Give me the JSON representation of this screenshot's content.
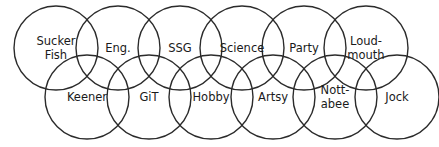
{
  "diagram": {
    "type": "circle-chain-venn",
    "canvas": {
      "width": 439,
      "height": 147,
      "background": "#ffffff"
    },
    "stroke_color": "#2b2b2b",
    "text_color": "#1a1a1a",
    "rows": [
      {
        "name": "top-row",
        "center_y": 48,
        "radius": 42,
        "nodes": [
          {
            "id": "sucker-fish",
            "label": "Sucker Fish",
            "lines": [
              "Sucker",
              "Fish"
            ],
            "cx": 56
          },
          {
            "id": "eng",
            "label": "Eng.",
            "lines": [
              "Eng."
            ],
            "cx": 118
          },
          {
            "id": "ssg",
            "label": "SSG",
            "lines": [
              "SSG"
            ],
            "cx": 180
          },
          {
            "id": "science",
            "label": "Science",
            "lines": [
              "Science"
            ],
            "cx": 242
          },
          {
            "id": "party",
            "label": "Party",
            "lines": [
              "Party"
            ],
            "cx": 304
          },
          {
            "id": "loud-mouth",
            "label": "Loud-mouth",
            "lines": [
              "Loud-",
              "mouth"
            ],
            "cx": 366
          }
        ]
      },
      {
        "name": "bottom-row",
        "center_y": 97,
        "radius": 42,
        "nodes": [
          {
            "id": "keener",
            "label": "Keener",
            "lines": [
              "Keener"
            ],
            "cx": 87
          },
          {
            "id": "git",
            "label": "GiT",
            "lines": [
              "GiT"
            ],
            "cx": 149
          },
          {
            "id": "hobby",
            "label": "Hobby",
            "lines": [
              "Hobby"
            ],
            "cx": 211
          },
          {
            "id": "artsy",
            "label": "Artsy",
            "lines": [
              "Artsy"
            ],
            "cx": 273
          },
          {
            "id": "nott-abee",
            "label": "Nott-abee",
            "lines": [
              "Nott-",
              "abee"
            ],
            "cx": 335
          },
          {
            "id": "jock",
            "label": "Jock",
            "lines": [
              "Jock"
            ],
            "cx": 397
          }
        ]
      }
    ]
  }
}
